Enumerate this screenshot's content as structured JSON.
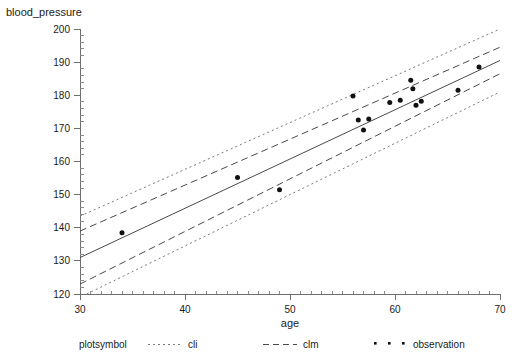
{
  "chart_data": {
    "type": "scatter",
    "title": "",
    "ylabel": "blood_pressure",
    "xlabel": "age",
    "xlim": [
      30,
      70
    ],
    "ylim": [
      120,
      200
    ],
    "xticks": [
      30,
      40,
      50,
      60,
      70
    ],
    "yticks": [
      120,
      130,
      140,
      150,
      160,
      170,
      180,
      190,
      200
    ],
    "xtick_labels": [
      "30",
      "40",
      "50",
      "60",
      "70"
    ],
    "ytick_labels": [
      "120",
      "130",
      "140",
      "150",
      "160",
      "170",
      "180",
      "190",
      "200"
    ],
    "x_minor_per_interval": 10,
    "y_minor_per_interval": 5,
    "grid": false,
    "legend_position": "bottom",
    "series": [
      {
        "name": "observation",
        "type": "scatter",
        "marker": "filled-circle",
        "points": [
          {
            "x": 34.0,
            "y": 138.5
          },
          {
            "x": 45.0,
            "y": 155.2
          },
          {
            "x": 49.0,
            "y": 151.5
          },
          {
            "x": 56.0,
            "y": 179.8
          },
          {
            "x": 56.5,
            "y": 172.5
          },
          {
            "x": 57.0,
            "y": 169.5
          },
          {
            "x": 57.5,
            "y": 172.8
          },
          {
            "x": 59.5,
            "y": 177.8
          },
          {
            "x": 60.5,
            "y": 178.5
          },
          {
            "x": 61.5,
            "y": 184.5
          },
          {
            "x": 61.7,
            "y": 182.0
          },
          {
            "x": 62.0,
            "y": 177.0
          },
          {
            "x": 62.5,
            "y": 178.2
          },
          {
            "x": 66.0,
            "y": 181.5
          },
          {
            "x": 68.0,
            "y": 188.5
          }
        ]
      },
      {
        "name": "fit",
        "type": "line",
        "style": "solid",
        "endpoints": [
          {
            "x": 30,
            "y": 131.0
          },
          {
            "x": 70,
            "y": 190.5
          }
        ]
      },
      {
        "name": "clm_upper",
        "type": "line",
        "style": "dashed",
        "endpoints": [
          {
            "x": 30,
            "y": 139.0
          },
          {
            "x": 70,
            "y": 194.5
          }
        ]
      },
      {
        "name": "clm_lower",
        "type": "line",
        "style": "dashed",
        "endpoints": [
          {
            "x": 30,
            "y": 123.0
          },
          {
            "x": 70,
            "y": 186.5
          }
        ]
      },
      {
        "name": "cli_upper",
        "type": "line",
        "style": "dotted",
        "endpoints": [
          {
            "x": 30,
            "y": 143.5
          },
          {
            "x": 70,
            "y": 200.0
          }
        ]
      },
      {
        "name": "cli_lower",
        "type": "line",
        "style": "dotted",
        "endpoints": [
          {
            "x": 30,
            "y": 119.0
          },
          {
            "x": 70,
            "y": 181.0
          }
        ]
      }
    ],
    "legend": {
      "caption": "plotsymbol",
      "entries": [
        {
          "label": "cli",
          "marker": "dotted-line"
        },
        {
          "label": "clm",
          "marker": "dashed-line"
        },
        {
          "label": "observation",
          "marker": "dots"
        }
      ]
    }
  }
}
